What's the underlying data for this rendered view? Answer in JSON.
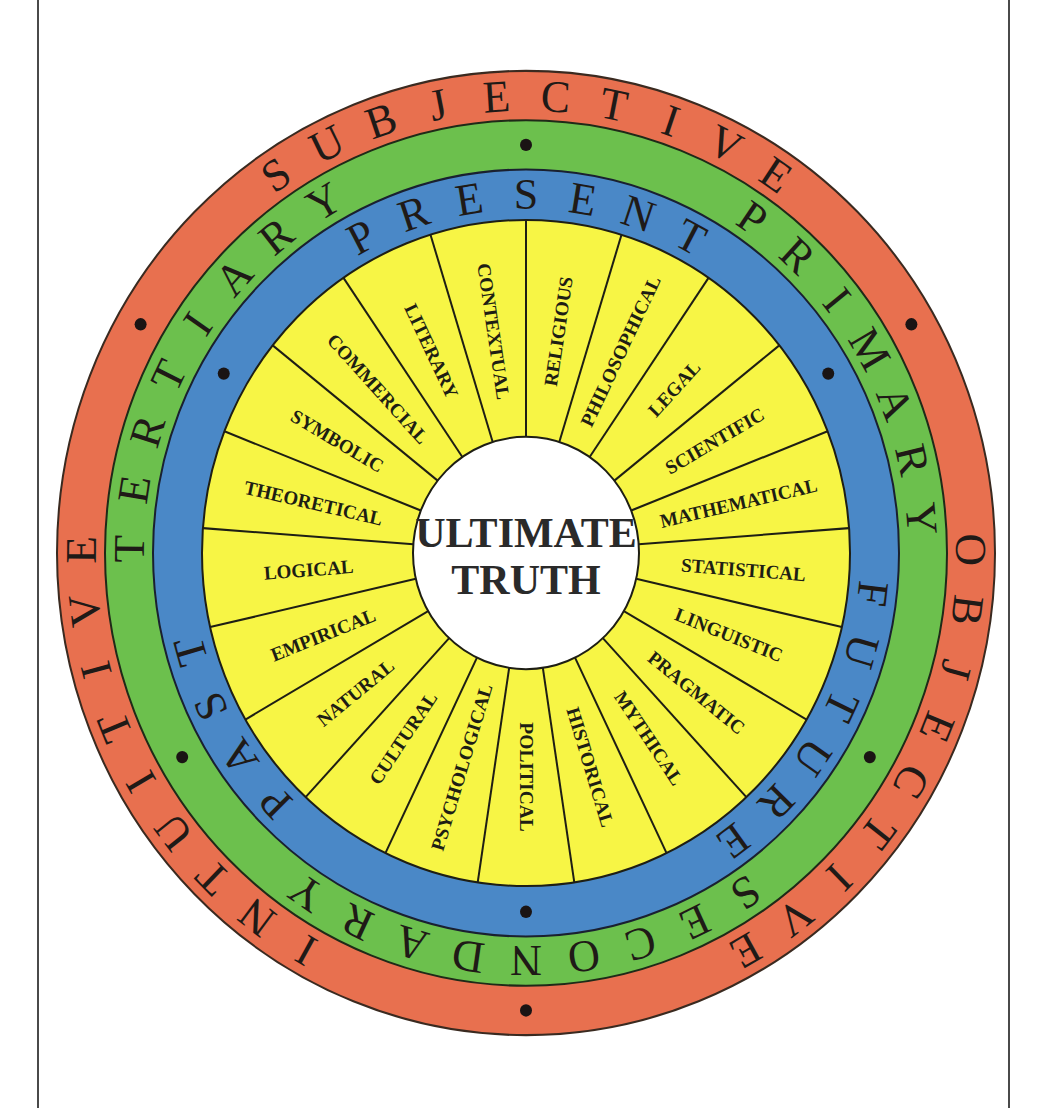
{
  "diagram": {
    "center": {
      "line1": "ULTIMATE",
      "line2": "TRUTH"
    },
    "colors": {
      "outer_ring": "#e8704f",
      "second_ring": "#6cc04d",
      "third_ring": "#4a88c7",
      "segments": "#f7f545",
      "center": "#ffffff",
      "lines": "#1e1e14"
    },
    "rings": [
      {
        "name": "outer",
        "words": [
          {
            "text": "SUBJECTIVE",
            "position": "top"
          },
          {
            "text": "OBJECTIVE",
            "position": "right"
          },
          {
            "text": "INTUITIVE",
            "position": "left"
          }
        ]
      },
      {
        "name": "second",
        "words": [
          {
            "text": "PRIMARY",
            "position": "upper-right"
          },
          {
            "text": "SECONDARY",
            "position": "bottom"
          },
          {
            "text": "TERTIARY",
            "position": "upper-left"
          }
        ]
      },
      {
        "name": "third",
        "words": [
          {
            "text": "PRESENT",
            "position": "top"
          },
          {
            "text": "FUTURE",
            "position": "lower-right"
          },
          {
            "text": "PAST",
            "position": "lower-left"
          }
        ]
      }
    ],
    "segments": [
      "RELIGIOUS",
      "PHILOSOPHICAL",
      "LEGAL",
      "SCIENTIFIC",
      "MATHEMATICAL",
      "STATISTICAL",
      "LINGUISTIC",
      "PRAGMATIC",
      "MYTHICAL",
      "HISTORICAL",
      "POLITICAL",
      "PSYCHOLOGICAL",
      "CULTURAL",
      "NATURAL",
      "EMPIRICAL",
      "LOGICAL",
      "THEORETICAL",
      "SYMBOLIC",
      "COMMERCIAL",
      "LITERARY",
      "CONTEXTUAL"
    ]
  }
}
